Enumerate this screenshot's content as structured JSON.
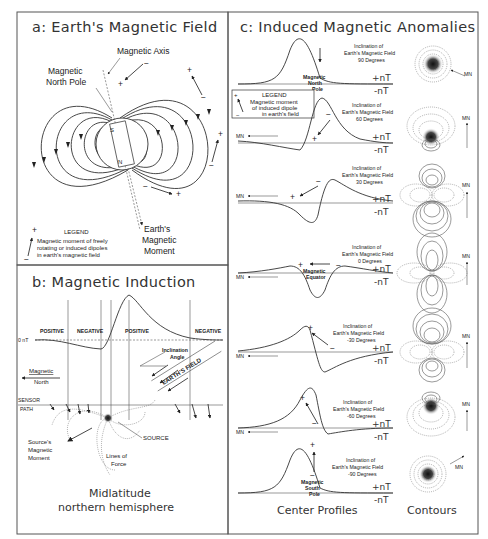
{
  "panel_a": {
    "title": "a: Earth's Magnetic Field",
    "magnetic_axis": "Magnetic Axis",
    "north_pole_l1": "Magnetic",
    "north_pole_l2": "North Pole",
    "pole_s": "S",
    "pole_n": "N",
    "moment_l1": "Earth's",
    "moment_l2": "Magnetic",
    "moment_l3": "Moment",
    "legend_title": "LEGEND",
    "legend_l1": "Magnetic moment of freely",
    "legend_l2": "rotating or induced dipoles",
    "legend_l3": "in earth's magnetic field",
    "plus": "+",
    "minus": "−"
  },
  "panel_b": {
    "title": "b: Magnetic Induction",
    "zero_label": "0 nT",
    "regions": [
      "POSITIVE",
      "NEGATIVE",
      "POSITIVE",
      "NEGATIVE"
    ],
    "inclination_l1": "Inclination",
    "inclination_l2": "Angle",
    "earths_field": "EARTH'S FIELD",
    "mag_north_l1": "Magnetic",
    "mag_north_l2": "North",
    "sensor_l1": "SENSOR",
    "sensor_l2": "PATH",
    "source": "SOURCE",
    "source_moment_l1": "Source's",
    "source_moment_l2": "Magnetic",
    "source_moment_l3": "Moment",
    "lines_force_l1": "Lines of",
    "lines_force_l2": "Force",
    "caption_l1": "Midlatitude",
    "caption_l2": "northern hemisphere"
  },
  "panel_c": {
    "title": "c: Induced Magnetic Anomalies",
    "incl_l1": "Inclination of",
    "incl_l2": "Earth's Magnetic Field",
    "plus_nt": "+nT",
    "minus_nt": "-nT",
    "mn": "MN",
    "legend_title": "LEGEND",
    "legend_l1": "Magnetic moment",
    "legend_l2": "of induced dipole",
    "legend_l3": "in earth's field",
    "rows": [
      {
        "degrees": "90 Degrees",
        "pole_l1": "Magnetic",
        "pole_l2": "North",
        "pole_l3": "Pole"
      },
      {
        "degrees": "60 Degrees"
      },
      {
        "degrees": "30 Degrees"
      },
      {
        "degrees": "0 Degrees",
        "pole_l1": "Magnetic",
        "pole_l2": "Equator"
      },
      {
        "degrees": "-30 Degrees"
      },
      {
        "degrees": "-60 Degrees"
      },
      {
        "degrees": "-90 Degrees",
        "pole_l1": "Magnetic",
        "pole_l2": "South",
        "pole_l3": "Pole"
      }
    ],
    "footer_profiles": "Center Profiles",
    "footer_contours": "Contours"
  }
}
